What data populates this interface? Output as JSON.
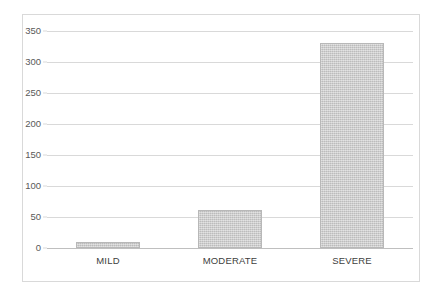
{
  "chart_data": {
    "type": "bar",
    "title": "",
    "subtitle": "",
    "xlabel": "",
    "ylabel": "",
    "categories": [
      "MILD",
      "MODERATE",
      "SEVERE"
    ],
    "values": [
      10,
      61,
      330
    ],
    "ylim": [
      0,
      350
    ],
    "ytick_step": 50,
    "yticks": [
      0,
      50,
      100,
      150,
      200,
      250,
      300,
      350
    ],
    "ytick_labels": [
      "0",
      "50",
      "100",
      "150",
      "200",
      "250",
      "300",
      "350"
    ],
    "grid": "horizontal",
    "legend": null,
    "legend_position": "none",
    "annotations": [],
    "series": [
      {
        "name": "",
        "values": [
          10,
          61,
          330
        ]
      }
    ]
  },
  "style": {
    "bar_fill": "#c9c9c9",
    "bar_border": "#b8b8b8",
    "gridline_color": "#d9d9d9",
    "axis_color": "#bfbfbf",
    "frame_border": "#d9d9d9",
    "tick_label_color": "#595959",
    "category_label_color": "#404040",
    "background": "#ffffff"
  }
}
